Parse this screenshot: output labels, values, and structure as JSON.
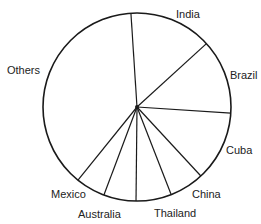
{
  "chart_data": {
    "type": "pie",
    "title": "",
    "start_angle_deg": -3.7,
    "direction": "clockwise",
    "center": [
      137,
      107
    ],
    "radius": 94,
    "slices": [
      {
        "label": "India",
        "percent": 14.3,
        "degrees": 51.3
      },
      {
        "label": "Brazil",
        "percent": 12.8,
        "degrees": 46.1
      },
      {
        "label": "Cuba",
        "percent": 12.1,
        "degrees": 43.5
      },
      {
        "label": "China",
        "percent": 6.0,
        "degrees": 21.5
      },
      {
        "label": "Thailand",
        "percent": 6.1,
        "degrees": 21.9
      },
      {
        "label": "Australia",
        "percent": 5.6,
        "degrees": 20.0
      },
      {
        "label": "Mexico",
        "percent": 5.1,
        "degrees": 18.3
      },
      {
        "label": "Others",
        "percent": 38.2,
        "degrees": 137.4
      }
    ],
    "labels_outside": true,
    "legend": "none",
    "fill": "none",
    "stroke_color": "#1a1a1a"
  },
  "labels": {
    "india": "India",
    "brazil": "Brazil",
    "cuba": "Cuba",
    "china": "China",
    "thailand": "Thailand",
    "australia": "Australia",
    "mexico": "Mexico",
    "others": "Others"
  }
}
